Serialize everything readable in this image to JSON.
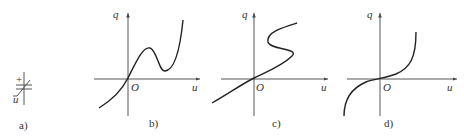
{
  "figure": {
    "panels": [
      {
        "id": "a",
        "caption": "a)",
        "description": "nonlinear capacitor symbol",
        "plus_sign": "+",
        "minus_sign": "-",
        "voltage_label": "u"
      },
      {
        "id": "b",
        "caption": "b)",
        "x_label": "u",
        "y_label": "q",
        "origin_label": "O",
        "curve": "N-shaped, non-monotonic (voltage-controlled)"
      },
      {
        "id": "c",
        "caption": "c)",
        "x_label": "u",
        "y_label": "q",
        "origin_label": "O",
        "curve": "S-shaped (charge-controlled)"
      },
      {
        "id": "d",
        "caption": "d)",
        "x_label": "u",
        "y_label": "q",
        "origin_label": "O",
        "curve": "monotonic odd-symmetric"
      }
    ]
  }
}
